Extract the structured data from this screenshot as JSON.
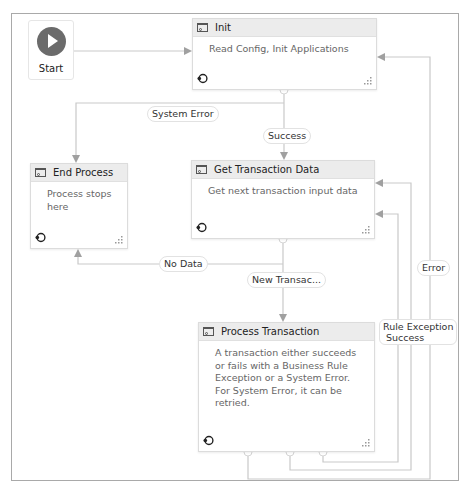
{
  "canvas": {
    "start": {
      "label": "Start",
      "icon": "play-icon"
    },
    "nodes": [
      {
        "id": "init",
        "title": "Init",
        "description": "Read Config, Init Applications"
      },
      {
        "id": "end_process",
        "title": "End Process",
        "description": "Process stops here"
      },
      {
        "id": "get_transaction_data",
        "title": "Get Transaction Data",
        "description": "Get next transaction input data"
      },
      {
        "id": "process_transaction",
        "title": "Process Transaction",
        "description": "A transaction either succeeds or fails with a Business Rule Exception or a System Error. For System Error, it can be retried."
      }
    ],
    "transitions": {
      "system_error": "System Error",
      "success_init": "Success",
      "no_data": "No Data",
      "new_transaction": "New Transac...",
      "error": "Error",
      "rule_exception": "Rule Exception",
      "success_pt": "Success"
    }
  },
  "colors": {
    "wire": "#c8c8c8",
    "arrow": "#9a9a9a",
    "border": "#a9a9a9",
    "header": "#ececec"
  }
}
